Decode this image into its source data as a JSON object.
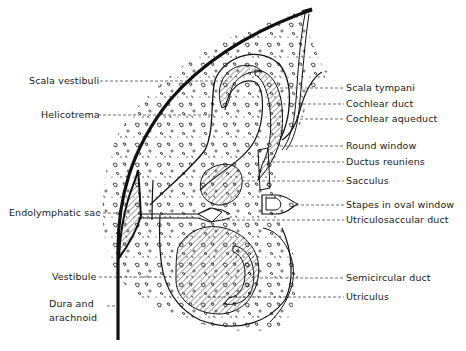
{
  "diagram": {
    "labels_left": [
      {
        "id": "scala-vestibuli",
        "text": "Scala vestibuli",
        "x": 29,
        "y": 75
      },
      {
        "id": "helicotrema",
        "text": "Helicotrema",
        "x": 41,
        "y": 109
      },
      {
        "id": "endolymphatic-sac",
        "text": "Endolymphatic sac",
        "x": 9,
        "y": 209
      },
      {
        "id": "vestibule",
        "text": "Vestibule",
        "x": 52,
        "y": 272
      },
      {
        "id": "dura-and-arachnoid",
        "text": "Dura and\narachnoid",
        "x": 49,
        "y": 299
      }
    ],
    "labels_right": [
      {
        "id": "scala-tympani",
        "text": "Scala tympani",
        "x": 346,
        "y": 83
      },
      {
        "id": "cochlear-duct",
        "text": "Cochlear duct",
        "x": 346,
        "y": 99
      },
      {
        "id": "cochlear-aqueduct",
        "text": "Cochlear aqueduct",
        "x": 346,
        "y": 114
      },
      {
        "id": "round-window",
        "text": "Round window",
        "x": 346,
        "y": 141
      },
      {
        "id": "ductus-reuniens",
        "text": "Ductus reuniens",
        "x": 346,
        "y": 157
      },
      {
        "id": "sacculus",
        "text": "Sacculus",
        "x": 346,
        "y": 176
      },
      {
        "id": "stapes-in-oval-window",
        "text": "Stapes in oval window",
        "x": 346,
        "y": 200
      },
      {
        "id": "utriculosaccular-duct",
        "text": "Utriculosaccular duct",
        "x": 346,
        "y": 215
      },
      {
        "id": "semicircular-duct",
        "text": "Semicircular duct",
        "x": 346,
        "y": 273
      },
      {
        "id": "utriculus",
        "text": "Utriculus",
        "x": 346,
        "y": 292
      }
    ],
    "colors": {
      "ink": "#1a1a1a",
      "background": "#ffffff",
      "hatch": "#333333"
    }
  }
}
